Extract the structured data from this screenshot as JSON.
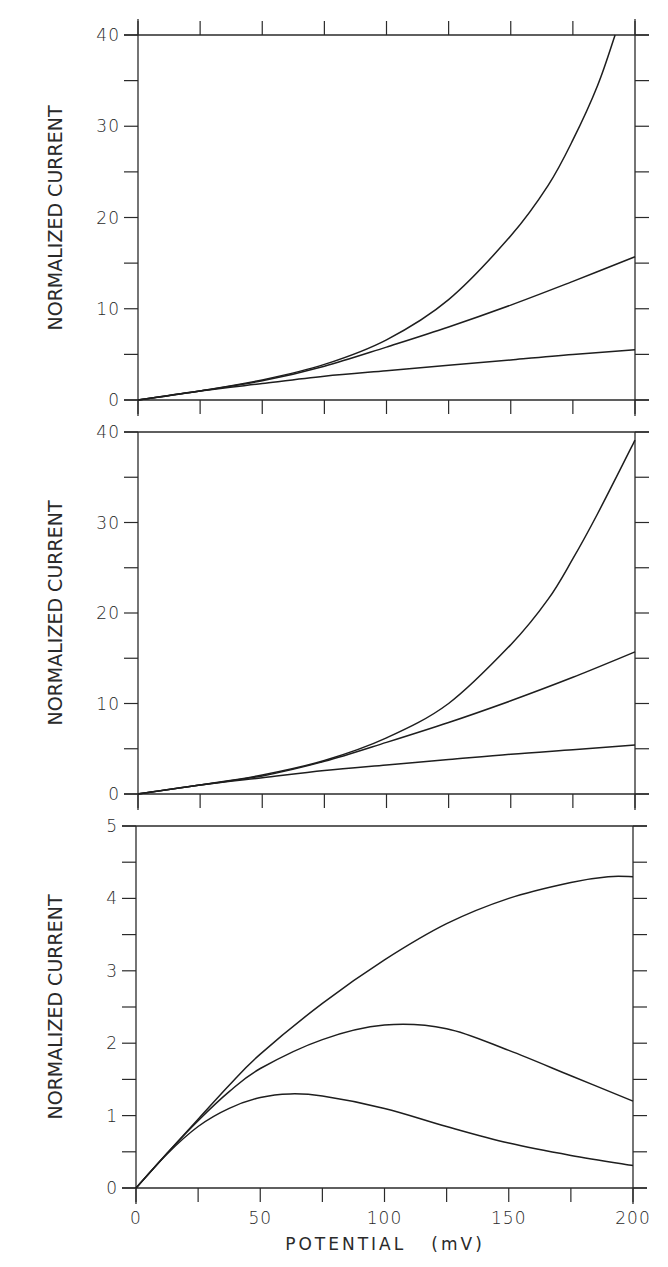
{
  "chart_data": [
    {
      "type": "line",
      "panel": "top",
      "title": "",
      "xlabel": "",
      "ylabel": "NORMALIZED CURRENT",
      "xlim": [
        0,
        200
      ],
      "ylim": [
        0,
        40
      ],
      "yticks": [
        0,
        10,
        20,
        30,
        40
      ],
      "yminor": 5,
      "xticks_step": 25,
      "top_ticks": true,
      "grid": false,
      "legend": null,
      "series": [
        {
          "name": "curve-upper",
          "x": [
            0,
            25,
            50,
            75,
            100,
            125,
            150,
            165,
            175,
            185,
            192
          ],
          "values": [
            0,
            1.0,
            2.2,
            3.9,
            6.6,
            11.0,
            18.0,
            23.5,
            28.5,
            34.5,
            40.0
          ]
        },
        {
          "name": "curve-middle",
          "x": [
            0,
            25,
            50,
            75,
            100,
            125,
            150,
            175,
            200
          ],
          "values": [
            0,
            1.0,
            2.1,
            3.7,
            5.8,
            8.0,
            10.4,
            13.0,
            15.7
          ]
        },
        {
          "name": "curve-lower",
          "x": [
            0,
            25,
            50,
            75,
            100,
            125,
            150,
            175,
            200
          ],
          "values": [
            0,
            1.0,
            1.8,
            2.6,
            3.2,
            3.8,
            4.4,
            5.0,
            5.5
          ]
        }
      ]
    },
    {
      "type": "line",
      "panel": "middle",
      "title": "",
      "xlabel": "",
      "ylabel": "NORMALIZED CURRENT",
      "xlim": [
        0,
        200
      ],
      "ylim": [
        0,
        40
      ],
      "yticks": [
        0,
        10,
        20,
        30,
        40
      ],
      "yminor": 5,
      "xticks_step": 25,
      "top_ticks": false,
      "grid": false,
      "legend": null,
      "series": [
        {
          "name": "curve-upper",
          "x": [
            0,
            25,
            50,
            75,
            100,
            125,
            150,
            165,
            175,
            185,
            200
          ],
          "values": [
            0,
            1.0,
            2.1,
            3.7,
            6.2,
            10.0,
            16.5,
            21.5,
            26.0,
            31.0,
            39.1
          ]
        },
        {
          "name": "curve-middle",
          "x": [
            0,
            25,
            50,
            75,
            100,
            125,
            150,
            175,
            200
          ],
          "values": [
            0,
            1.0,
            2.0,
            3.6,
            5.7,
            7.9,
            10.3,
            12.9,
            15.7
          ]
        },
        {
          "name": "curve-lower",
          "x": [
            0,
            25,
            50,
            75,
            100,
            125,
            150,
            175,
            200
          ],
          "values": [
            0,
            1.0,
            1.8,
            2.6,
            3.2,
            3.8,
            4.4,
            4.9,
            5.4
          ]
        }
      ]
    },
    {
      "type": "line",
      "panel": "bottom",
      "title": "",
      "xlabel": "POTENTIAL (mV)",
      "ylabel": "NORMALIZED CURRENT",
      "xlim": [
        0,
        200
      ],
      "ylim": [
        0,
        5
      ],
      "yticks": [
        0,
        1,
        2,
        3,
        4,
        5
      ],
      "yminor": 0.5,
      "xticks": [
        0,
        50,
        100,
        150,
        200
      ],
      "xticks_step": 25,
      "top_ticks": false,
      "grid": false,
      "legend": null,
      "series": [
        {
          "name": "curve-upper",
          "x": [
            0,
            12.5,
            25,
            37.5,
            50,
            75,
            100,
            125,
            150,
            175,
            190,
            200
          ],
          "values": [
            0,
            0.48,
            0.95,
            1.42,
            1.85,
            2.55,
            3.15,
            3.65,
            4.0,
            4.22,
            4.3,
            4.3
          ]
        },
        {
          "name": "curve-middle",
          "x": [
            0,
            12.5,
            25,
            37.5,
            50,
            75,
            100,
            125,
            150,
            175,
            200
          ],
          "values": [
            0,
            0.48,
            0.93,
            1.33,
            1.65,
            2.05,
            2.25,
            2.2,
            1.9,
            1.55,
            1.2
          ]
        },
        {
          "name": "curve-lower",
          "x": [
            0,
            12.5,
            25,
            37.5,
            50,
            62,
            75,
            100,
            125,
            150,
            175,
            200
          ],
          "values": [
            0,
            0.47,
            0.85,
            1.1,
            1.25,
            1.3,
            1.27,
            1.1,
            0.85,
            0.62,
            0.45,
            0.31
          ]
        }
      ]
    }
  ],
  "panels": [
    {
      "ylabel": "NORMALIZED CURRENT",
      "ytick_labels": [
        "0",
        "10",
        "20",
        "30",
        "40"
      ]
    },
    {
      "ylabel": "NORMALIZED CURRENT",
      "ytick_labels": [
        "0",
        "10",
        "20",
        "30",
        "40"
      ]
    },
    {
      "ylabel": "NORMALIZED CURRENT",
      "ytick_labels": [
        "0",
        "1",
        "2",
        "3",
        "4",
        "5"
      ],
      "xtick_labels": [
        "0",
        "50",
        "100",
        "150",
        "200"
      ],
      "xlabel": "POTENTIAL   (mV)"
    }
  ],
  "colors": {
    "ink": "#1e1e1e",
    "background": "#ffffff"
  }
}
